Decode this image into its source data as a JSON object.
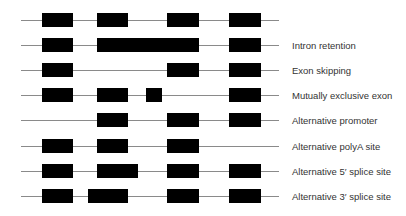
{
  "colors": {
    "exon": "#000000",
    "intron": "#8a8a8a",
    "label": "#333333"
  },
  "rows": [
    {
      "label": "",
      "y": 13,
      "exons": [
        [
          42,
          73
        ],
        [
          97,
          128
        ],
        [
          167,
          199
        ],
        [
          229,
          261
        ]
      ]
    },
    {
      "label": "Intron retention",
      "y": 38,
      "exons": [
        [
          42,
          73
        ],
        [
          97,
          199
        ],
        [
          229,
          261
        ]
      ]
    },
    {
      "label": "Exon skipping",
      "y": 63,
      "exons": [
        [
          42,
          73
        ],
        [
          167,
          199
        ],
        [
          229,
          261
        ]
      ]
    },
    {
      "label": "Mutually exclusive exon",
      "y": 88,
      "exons": [
        [
          42,
          73
        ],
        [
          97,
          128
        ],
        [
          146,
          162
        ],
        [
          229,
          261
        ]
      ]
    },
    {
      "label": "Alternative promoter",
      "y": 113,
      "exons": [
        [
          97,
          128
        ],
        [
          167,
          199
        ],
        [
          229,
          261
        ]
      ]
    },
    {
      "label": "Alternative polyA site",
      "y": 139,
      "exons": [
        [
          42,
          73
        ],
        [
          97,
          128
        ],
        [
          167,
          199
        ]
      ]
    },
    {
      "label": "Alternative 5′ splice site",
      "y": 164,
      "exons": [
        [
          42,
          73
        ],
        [
          97,
          138
        ],
        [
          167,
          199
        ],
        [
          229,
          261
        ]
      ]
    },
    {
      "label": "Alternative 3′ splice site",
      "y": 189,
      "exons": [
        [
          42,
          73
        ],
        [
          88,
          128
        ],
        [
          167,
          199
        ],
        [
          229,
          261
        ]
      ]
    }
  ]
}
